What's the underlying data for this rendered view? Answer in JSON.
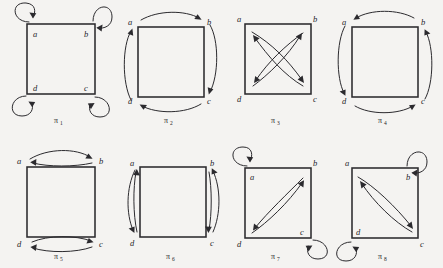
{
  "figure": {
    "background_color": "#f4f3f1",
    "ink_color": "#2b2a2e",
    "vertex_labels": [
      "a",
      "b",
      "c",
      "d"
    ],
    "vertex_positions": {
      "a": "top-left",
      "b": "top-right",
      "c": "bottom-right",
      "d": "bottom-left"
    },
    "rows": 2,
    "columns": 4
  },
  "diagrams": [
    {
      "id": "pi-1",
      "caption": "π",
      "caption_subscript": "1",
      "row": 1,
      "column": 1,
      "labels": {
        "a": "a",
        "b": "b",
        "c": "c",
        "d": "d"
      },
      "arrow_style": "self-loops",
      "arrows": [
        {
          "from": "a",
          "to": "a",
          "kind": "loop",
          "side": "top-left"
        },
        {
          "from": "b",
          "to": "b",
          "kind": "loop",
          "side": "top-right"
        },
        {
          "from": "c",
          "to": "c",
          "kind": "loop",
          "side": "bottom-right"
        },
        {
          "from": "d",
          "to": "d",
          "kind": "loop",
          "side": "bottom-left"
        }
      ]
    },
    {
      "id": "pi-2",
      "caption": "π",
      "caption_subscript": "2",
      "row": 1,
      "column": 2,
      "labels": {
        "a": "a",
        "b": "b",
        "c": "c",
        "d": "d"
      },
      "arrow_style": "outer-cycle-clockwise",
      "arrows": [
        {
          "from": "a",
          "to": "b",
          "kind": "outer-arc",
          "side": "top"
        },
        {
          "from": "b",
          "to": "c",
          "kind": "outer-arc",
          "side": "right"
        },
        {
          "from": "c",
          "to": "d",
          "kind": "outer-arc",
          "side": "bottom"
        },
        {
          "from": "d",
          "to": "a",
          "kind": "outer-arc",
          "side": "left"
        }
      ]
    },
    {
      "id": "pi-3",
      "caption": "π",
      "caption_subscript": "3",
      "row": 1,
      "column": 3,
      "labels": {
        "a": "a",
        "b": "b",
        "c": "c",
        "d": "d"
      },
      "arrow_style": "crossed-diagonals",
      "arrows": [
        {
          "from": "a",
          "to": "c",
          "kind": "diagonal",
          "side": "main"
        },
        {
          "from": "c",
          "to": "a",
          "kind": "diagonal",
          "side": "main"
        },
        {
          "from": "b",
          "to": "d",
          "kind": "diagonal",
          "side": "anti"
        },
        {
          "from": "d",
          "to": "b",
          "kind": "diagonal",
          "side": "anti"
        }
      ]
    },
    {
      "id": "pi-4",
      "caption": "π",
      "caption_subscript": "4",
      "row": 1,
      "column": 4,
      "labels": {
        "a": "a",
        "b": "b",
        "c": "c",
        "d": "d"
      },
      "arrow_style": "outer-cycle-counterclockwise",
      "arrows": [
        {
          "from": "b",
          "to": "a",
          "kind": "outer-arc",
          "side": "top"
        },
        {
          "from": "a",
          "to": "d",
          "kind": "outer-arc",
          "side": "left"
        },
        {
          "from": "d",
          "to": "c",
          "kind": "outer-arc",
          "side": "bottom"
        },
        {
          "from": "c",
          "to": "b",
          "kind": "outer-arc",
          "side": "right"
        }
      ]
    },
    {
      "id": "pi-5",
      "caption": "π",
      "caption_subscript": "5",
      "row": 2,
      "column": 1,
      "labels": {
        "a": "a",
        "b": "b",
        "c": "c",
        "d": "d"
      },
      "arrow_style": "horizontal-swaps",
      "arrows": [
        {
          "from": "a",
          "to": "b",
          "kind": "lens",
          "side": "top"
        },
        {
          "from": "b",
          "to": "a",
          "kind": "lens",
          "side": "top"
        },
        {
          "from": "d",
          "to": "c",
          "kind": "lens",
          "side": "bottom"
        },
        {
          "from": "c",
          "to": "d",
          "kind": "lens",
          "side": "bottom"
        }
      ]
    },
    {
      "id": "pi-6",
      "caption": "π",
      "caption_subscript": "6",
      "row": 2,
      "column": 2,
      "labels": {
        "a": "a",
        "b": "b",
        "c": "c",
        "d": "d"
      },
      "arrow_style": "vertical-swaps",
      "arrows": [
        {
          "from": "a",
          "to": "d",
          "kind": "lens",
          "side": "left"
        },
        {
          "from": "d",
          "to": "a",
          "kind": "lens",
          "side": "left"
        },
        {
          "from": "b",
          "to": "c",
          "kind": "lens",
          "side": "right"
        },
        {
          "from": "c",
          "to": "b",
          "kind": "lens",
          "side": "right"
        }
      ]
    },
    {
      "id": "pi-7",
      "caption": "π",
      "caption_subscript": "7",
      "row": 2,
      "column": 3,
      "labels": {
        "a": "a",
        "b": "b",
        "c": "c",
        "d": "d"
      },
      "arrow_style": "anti-diagonal-swap-with-loops",
      "arrows": [
        {
          "from": "a",
          "to": "a",
          "kind": "loop",
          "side": "top-left"
        },
        {
          "from": "c",
          "to": "c",
          "kind": "loop",
          "side": "bottom-right"
        },
        {
          "from": "d",
          "to": "b",
          "kind": "lens",
          "side": "anti"
        },
        {
          "from": "b",
          "to": "d",
          "kind": "lens",
          "side": "anti"
        }
      ]
    },
    {
      "id": "pi-8",
      "caption": "π",
      "caption_subscript": "8",
      "row": 2,
      "column": 4,
      "labels": {
        "a": "a",
        "b": "b",
        "c": "c",
        "d": "d"
      },
      "arrow_style": "main-diagonal-swap-with-loops",
      "arrows": [
        {
          "from": "b",
          "to": "b",
          "kind": "loop",
          "side": "top-right"
        },
        {
          "from": "d",
          "to": "d",
          "kind": "loop",
          "side": "bottom-left"
        },
        {
          "from": "a",
          "to": "c",
          "kind": "lens",
          "side": "main"
        },
        {
          "from": "c",
          "to": "a",
          "kind": "lens",
          "side": "main"
        }
      ]
    }
  ]
}
